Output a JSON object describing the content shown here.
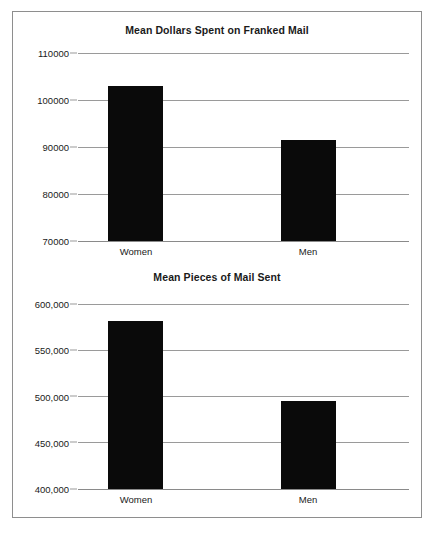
{
  "chart_data": [
    {
      "type": "bar",
      "title": "Mean Dollars Spent on Franked Mail",
      "categories": [
        "Women",
        "Men"
      ],
      "values": [
        103000,
        91500
      ],
      "xlabel": "",
      "ylabel": "",
      "ylim": [
        70000,
        110000
      ],
      "yticks": [
        70000,
        80000,
        90000,
        100000,
        110000
      ],
      "ytick_labels": [
        "70000",
        "80000",
        "90000",
        "100000",
        "110000"
      ],
      "grid": true,
      "legend": "none",
      "bar_color": "#0a0a0a"
    },
    {
      "type": "bar",
      "title": "Mean Pieces of Mail Sent",
      "categories": [
        "Women",
        "Men"
      ],
      "values": [
        582000,
        495000
      ],
      "xlabel": "",
      "ylabel": "",
      "ylim": [
        400000,
        600000
      ],
      "yticks": [
        400000,
        450000,
        500000,
        550000,
        600000
      ],
      "ytick_labels": [
        "400,000",
        "450,000",
        "500,000",
        "550,000",
        "600,000"
      ],
      "grid": true,
      "legend": "none",
      "bar_color": "#0a0a0a"
    }
  ]
}
